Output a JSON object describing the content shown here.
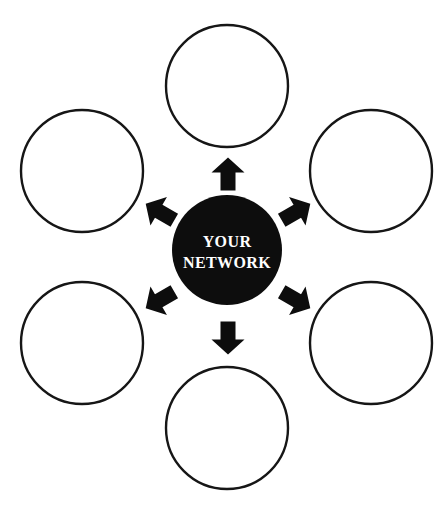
{
  "diagram": {
    "type": "hub-and-spoke",
    "title": "YOUR NETWORK",
    "background_color": "#ffffff",
    "hub": {
      "label_line_1": "YOUR",
      "label_line_2": "NETWORK",
      "fill_color": "#0d0d0d",
      "text_color": "#ffffff",
      "center_x": 227,
      "center_y": 250,
      "radius": 55
    },
    "node_style": {
      "fill_color": "#ffffff",
      "stroke_color": "#161616",
      "stroke_width": 2.4,
      "radius": 61
    },
    "arrow_style": {
      "fill_color": "#0d0d0d",
      "count": 6,
      "direction": "outward-from-hub"
    },
    "nodes": [
      {
        "name": "node-top",
        "label": "",
        "angle_deg": 270,
        "cx": 227,
        "cy": 86
      },
      {
        "name": "node-top-right",
        "label": "",
        "angle_deg": 330,
        "cx": 371,
        "cy": 171
      },
      {
        "name": "node-bottom-right",
        "label": "",
        "angle_deg": 30,
        "cx": 371,
        "cy": 343
      },
      {
        "name": "node-bottom",
        "label": "",
        "angle_deg": 90,
        "cx": 227,
        "cy": 428
      },
      {
        "name": "node-bottom-left",
        "label": "",
        "angle_deg": 150,
        "cx": 82,
        "cy": 343
      },
      {
        "name": "node-top-left",
        "label": "",
        "angle_deg": 210,
        "cx": 82,
        "cy": 171
      }
    ],
    "arrows": [
      {
        "name": "arrow-up",
        "angle_deg": 270,
        "cx": 228,
        "cy": 174
      },
      {
        "name": "arrow-up-right",
        "angle_deg": 330,
        "cx": 296,
        "cy": 212
      },
      {
        "name": "arrow-down-right",
        "angle_deg": 30,
        "cx": 296,
        "cy": 300
      },
      {
        "name": "arrow-down",
        "angle_deg": 90,
        "cx": 228,
        "cy": 338
      },
      {
        "name": "arrow-down-left",
        "angle_deg": 150,
        "cx": 160,
        "cy": 300
      },
      {
        "name": "arrow-up-left",
        "angle_deg": 210,
        "cx": 160,
        "cy": 212
      }
    ]
  }
}
